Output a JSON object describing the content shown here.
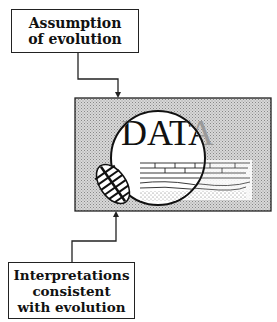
{
  "top_box": {
    "lines": [
      "Assumption",
      "of evolution"
    ]
  },
  "data_panel": {
    "label": "DATA",
    "illustration": [
      "trilobite-fossil",
      "rock-strata",
      "magnifying-lens"
    ]
  },
  "bottom_box": {
    "lines": [
      "Interpretations",
      "consistent",
      "with evolution"
    ]
  },
  "colors": {
    "panel_fill": "#c8c8c8",
    "line": "#222222"
  }
}
